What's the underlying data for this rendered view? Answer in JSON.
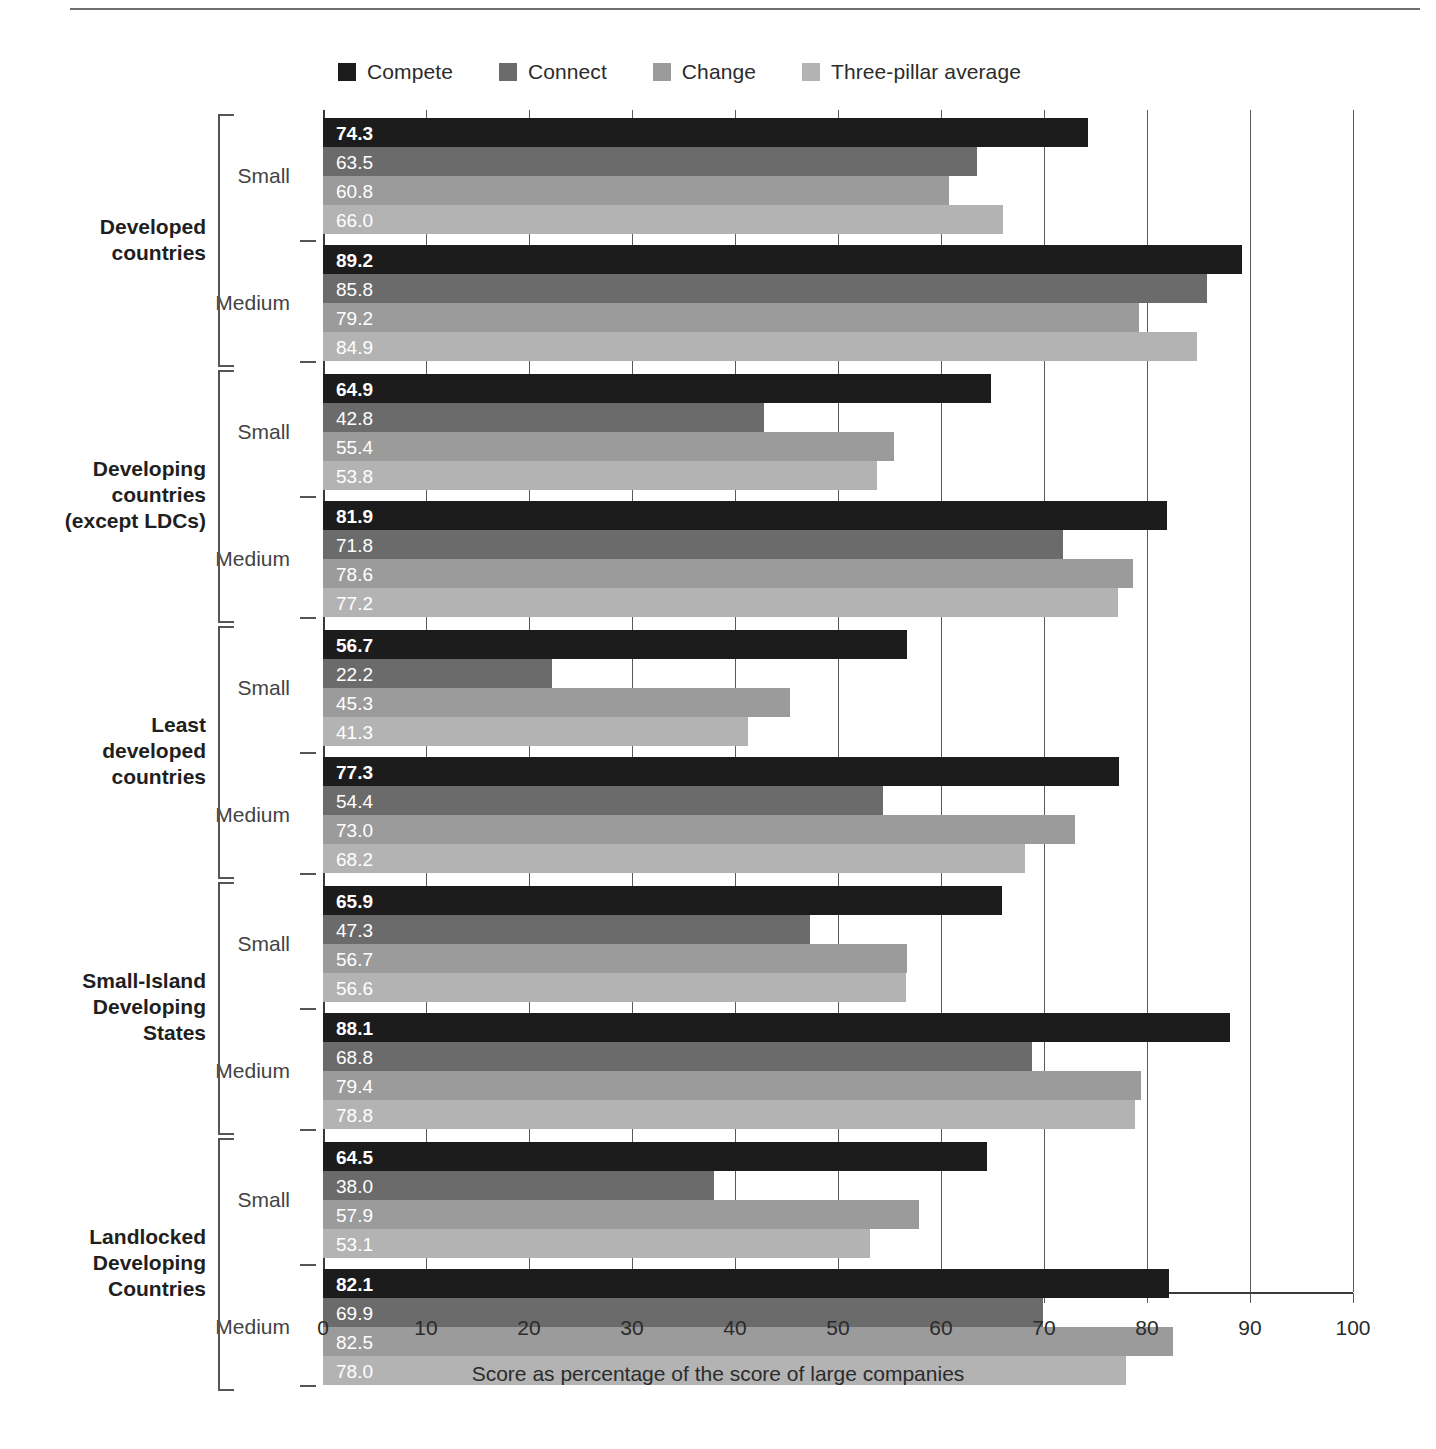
{
  "legend": {
    "items": [
      {
        "label": "Compete",
        "color": "#1c1c1c"
      },
      {
        "label": "Connect",
        "color": "#6b6b6b"
      },
      {
        "label": "Change",
        "color": "#9b9b9b"
      },
      {
        "label": "Three-pillar average",
        "color": "#b3b3b3"
      }
    ]
  },
  "axis": {
    "title": "Score as percentage of the score of large companies",
    "ticks": [
      "0",
      "10",
      "20",
      "30",
      "40",
      "50",
      "60",
      "70",
      "80",
      "90",
      "100"
    ]
  },
  "size_labels": {
    "small": "Small",
    "medium": "Medium"
  },
  "chart_data": {
    "type": "bar",
    "orientation": "horizontal",
    "title": "",
    "xlabel": "Score as percentage of the score of large companies",
    "ylabel": "",
    "xlim": [
      0,
      100
    ],
    "xticks": [
      0,
      10,
      20,
      30,
      40,
      50,
      60,
      70,
      80,
      90,
      100
    ],
    "grid": true,
    "legend_position": "top",
    "series": [
      {
        "name": "Compete",
        "color": "#1c1c1c"
      },
      {
        "name": "Connect",
        "color": "#6b6b6b"
      },
      {
        "name": "Change",
        "color": "#9b9b9b"
      },
      {
        "name": "Three-pillar average",
        "color": "#b3b3b3"
      }
    ],
    "groups": [
      {
        "label": "Developed\ncountries",
        "subgroups": [
          {
            "size": "Small",
            "values": [
              74.3,
              63.5,
              60.8,
              66.0
            ],
            "labels": [
              "74.3",
              "63.5",
              "60.8",
              "66.0"
            ]
          },
          {
            "size": "Medium",
            "values": [
              89.2,
              85.8,
              79.2,
              84.9
            ],
            "labels": [
              "89.2",
              "85.8",
              "79.2",
              "84.9"
            ]
          }
        ]
      },
      {
        "label": "Developing\ncountries\n(except LDCs)",
        "subgroups": [
          {
            "size": "Small",
            "values": [
              64.9,
              42.8,
              55.4,
              53.8
            ],
            "labels": [
              "64.9",
              "42.8",
              "55.4",
              "53.8"
            ]
          },
          {
            "size": "Medium",
            "values": [
              81.9,
              71.8,
              78.6,
              77.2
            ],
            "labels": [
              "81.9",
              "71.8",
              "78.6",
              "77.2"
            ]
          }
        ]
      },
      {
        "label": "Least\ndeveloped\ncountries",
        "subgroups": [
          {
            "size": "Small",
            "values": [
              56.7,
              22.2,
              45.3,
              41.3
            ],
            "labels": [
              "56.7",
              "22.2",
              "45.3",
              "41.3"
            ]
          },
          {
            "size": "Medium",
            "values": [
              77.3,
              54.4,
              73.0,
              68.2
            ],
            "labels": [
              "77.3",
              "54.4",
              "73.0",
              "68.2"
            ]
          }
        ]
      },
      {
        "label": "Small-Island\nDeveloping\nStates",
        "subgroups": [
          {
            "size": "Small",
            "values": [
              65.9,
              47.3,
              56.7,
              56.6
            ],
            "labels": [
              "65.9",
              "47.3",
              "56.7",
              "56.6"
            ]
          },
          {
            "size": "Medium",
            "values": [
              88.1,
              68.8,
              79.4,
              78.8
            ],
            "labels": [
              "88.1",
              "68.8",
              "79.4",
              "78.8"
            ]
          }
        ]
      },
      {
        "label": "Landlocked\nDeveloping\nCountries",
        "subgroups": [
          {
            "size": "Small",
            "values": [
              64.5,
              38.0,
              57.9,
              53.1
            ],
            "labels": [
              "64.5",
              "38.0",
              "57.9",
              "53.1"
            ]
          },
          {
            "size": "Medium",
            "values": [
              82.1,
              69.9,
              82.5,
              78.0
            ],
            "labels": [
              "82.1",
              "69.9",
              "82.5",
              "78.0"
            ]
          }
        ]
      }
    ]
  }
}
